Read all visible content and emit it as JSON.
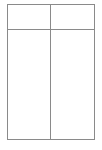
{
  "document": {
    "type": "table",
    "description": "empty-two-column-table",
    "background_color": "#ffffff"
  },
  "table": {
    "border_color": "#8a8a8a",
    "border_width_px": 1.5,
    "cell_background": "#ffffff",
    "columns": 2,
    "rows": 2,
    "has_header_row": true,
    "header": {
      "cells": [
        {
          "text": ""
        },
        {
          "text": ""
        }
      ]
    },
    "body": {
      "rows": [
        {
          "cells": [
            {
              "text": ""
            },
            {
              "text": ""
            }
          ]
        }
      ]
    }
  }
}
